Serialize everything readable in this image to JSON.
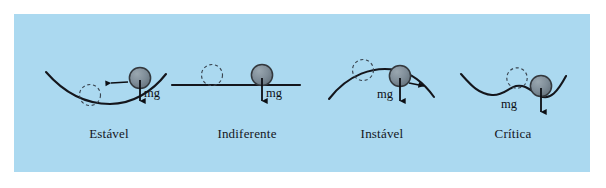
{
  "figure": {
    "background_color": "#abd9f0",
    "page_color": "#ffffff",
    "curve_color": "#14161c",
    "ball_fill": "#7b8a95",
    "ball_stroke": "#33383d",
    "ghost_stroke": "#3a4550",
    "arrow_color": "#0d0f14"
  },
  "panels": [
    {
      "id": "estavel",
      "label": "Estável",
      "label_x": 109,
      "label_y": 133,
      "surface_type": "concave-up",
      "weight_label": "mg",
      "mg_x": 139,
      "mg_y": 92,
      "has_restoring_arrow": true,
      "restoring_arrow_direction": "left"
    },
    {
      "id": "indiferente",
      "label": "Indiferente",
      "label_x": 247,
      "label_y": 133,
      "surface_type": "flat",
      "weight_label": "mg",
      "mg_x": 261,
      "mg_y": 92,
      "has_restoring_arrow": false,
      "restoring_arrow_direction": "none"
    },
    {
      "id": "instavel",
      "label": "Instável",
      "label_x": 382,
      "label_y": 133,
      "surface_type": "convex-dome",
      "weight_label": "mg",
      "mg_x": 381,
      "mg_y": 93,
      "has_restoring_arrow": true,
      "restoring_arrow_direction": "right"
    },
    {
      "id": "critica",
      "label": "Crítica",
      "label_x": 513,
      "label_y": 133,
      "surface_type": "wavy",
      "weight_label": "mg",
      "mg_x": 505,
      "mg_y": 103,
      "has_restoring_arrow": false,
      "restoring_arrow_direction": "none"
    }
  ]
}
